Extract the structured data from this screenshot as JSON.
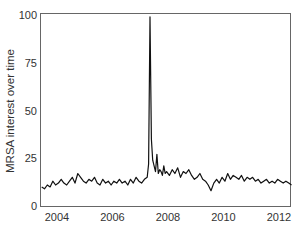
{
  "chart_data": {
    "type": "line",
    "title": "",
    "xlabel": "",
    "ylabel": "MRSA interest over time",
    "xlim": [
      2003.45,
      2012.45
    ],
    "ylim": [
      0,
      100
    ],
    "x_ticks": [
      2004,
      2006,
      2008,
      2010,
      2012
    ],
    "x_tick_labels": [
      "2004",
      "2006",
      "2008",
      "2010",
      "2012"
    ],
    "y_ticks": [
      0,
      25,
      50,
      75,
      100
    ],
    "y_tick_labels": [
      "0",
      "25",
      "50",
      "75",
      "100"
    ],
    "grid": false,
    "legend": null,
    "series": [
      {
        "name": "MRSA interest over time",
        "color": "#111111",
        "x": [
          2003.45,
          2003.55,
          2003.65,
          2003.75,
          2003.85,
          2003.95,
          2004.05,
          2004.15,
          2004.25,
          2004.35,
          2004.45,
          2004.55,
          2004.65,
          2004.75,
          2004.85,
          2004.95,
          2005.05,
          2005.15,
          2005.25,
          2005.35,
          2005.45,
          2005.55,
          2005.65,
          2005.75,
          2005.85,
          2005.95,
          2006.05,
          2006.15,
          2006.25,
          2006.35,
          2006.45,
          2006.55,
          2006.65,
          2006.75,
          2006.85,
          2006.95,
          2007.05,
          2007.15,
          2007.25,
          2007.3,
          2007.35,
          2007.4,
          2007.45,
          2007.5,
          2007.55,
          2007.6,
          2007.65,
          2007.7,
          2007.75,
          2007.8,
          2007.85,
          2007.9,
          2007.95,
          2008.05,
          2008.15,
          2008.25,
          2008.35,
          2008.45,
          2008.55,
          2008.65,
          2008.75,
          2008.85,
          2008.95,
          2009.05,
          2009.15,
          2009.25,
          2009.35,
          2009.45,
          2009.55,
          2009.65,
          2009.75,
          2009.85,
          2009.95,
          2010.05,
          2010.15,
          2010.25,
          2010.35,
          2010.45,
          2010.55,
          2010.65,
          2010.75,
          2010.85,
          2010.95,
          2011.05,
          2011.15,
          2011.25,
          2011.35,
          2011.45,
          2011.55,
          2011.65,
          2011.75,
          2011.85,
          2011.95,
          2012.05,
          2012.15,
          2012.25,
          2012.35,
          2012.45
        ],
        "values": [
          10,
          9,
          11,
          10,
          13,
          11,
          12,
          14,
          12,
          11,
          13,
          15,
          12,
          17,
          15,
          13,
          12,
          14,
          13,
          15,
          12,
          11,
          14,
          12,
          13,
          11,
          13,
          12,
          14,
          12,
          13,
          11,
          14,
          12,
          15,
          13,
          12,
          14,
          15,
          22,
          99,
          35,
          24,
          21,
          18,
          27,
          17,
          19,
          18,
          16,
          21,
          17,
          18,
          16,
          19,
          17,
          20,
          15,
          18,
          17,
          19,
          16,
          14,
          15,
          17,
          14,
          13,
          11,
          8,
          12,
          14,
          12,
          15,
          13,
          17,
          14,
          16,
          15,
          14,
          16,
          13,
          15,
          14,
          15,
          13,
          14,
          12,
          13,
          14,
          12,
          13,
          12,
          14,
          13,
          12,
          13,
          12,
          11
        ]
      }
    ]
  }
}
